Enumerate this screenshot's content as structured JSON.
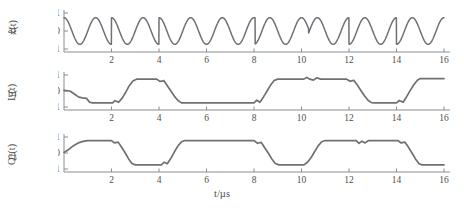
{
  "figure": {
    "panels": [
      {
        "letter": "a)",
        "ylabel_main": "x(t)",
        "ylabel_sub": "",
        "yticks": [
          "1",
          "0",
          "-1"
        ],
        "xticks": [
          "2",
          "4",
          "6",
          "8",
          "10",
          "12",
          "14",
          "16"
        ]
      },
      {
        "letter": "b)",
        "ylabel_main": "I",
        "ylabel_sub": "1",
        "ylabel_tail": "(t)",
        "yticks": [
          "1",
          "0",
          "-1"
        ],
        "xticks": [
          "2",
          "4",
          "6",
          "8",
          "10",
          "12",
          "14",
          "16"
        ]
      },
      {
        "letter": "c)",
        "ylabel_main": "Q",
        "ylabel_sub": "1",
        "ylabel_tail": "(t)",
        "yticks": [
          "1",
          "0",
          "-1"
        ],
        "xticks": [
          "2",
          "4",
          "6",
          "8",
          "10",
          "12",
          "14",
          "16"
        ]
      }
    ],
    "xaxis_label": "t/µs",
    "colors": {
      "trace": "#6e7075",
      "axis": "#8a8c90",
      "text": "#4f4f4f",
      "background": "#ffffff"
    }
  },
  "chart_data": [
    {
      "type": "line",
      "title": "",
      "panel": "a",
      "ylabel": "x(t)",
      "xlabel": "t/µs",
      "xlim": [
        0,
        16
      ],
      "ylim": [
        -1.35,
        1.35
      ],
      "xticks": [
        2,
        4,
        6,
        8,
        10,
        12,
        14,
        16
      ],
      "yticks": [
        -1,
        0,
        1
      ],
      "grid": false,
      "legend": null,
      "description": "Phase-modulated carrier with abrupt phase reversals",
      "carrier_cycles_per_us": 0.75,
      "phase_jumps_at": [
        2.0,
        4.0,
        8.05,
        10.3,
        12.0,
        14.0
      ],
      "x": [
        0,
        0.1,
        0.2,
        0.3,
        0.4,
        0.5,
        0.6,
        0.7,
        0.8,
        0.9,
        1,
        1.1,
        1.2,
        1.3,
        1.4,
        1.5,
        1.6,
        1.7,
        1.8,
        1.9,
        2,
        2.1,
        2.2,
        2.3,
        2.4,
        2.5,
        2.6,
        2.7,
        2.8,
        2.9,
        3,
        3.1,
        3.2,
        3.3,
        3.4,
        3.5,
        3.6,
        3.7,
        3.8,
        3.9,
        4,
        4.1,
        4.2,
        4.3,
        4.4,
        4.5,
        4.6,
        4.7,
        4.8,
        4.9,
        5,
        5.1,
        5.2,
        5.3,
        5.4,
        5.5,
        5.6,
        5.7,
        5.8,
        5.9,
        6,
        6.2,
        6.4,
        6.6,
        6.8,
        7,
        7.2,
        7.4,
        7.6,
        7.8,
        8,
        8.2,
        8.4,
        8.6,
        8.8,
        9,
        9.2,
        9.4,
        9.6,
        9.8,
        10,
        10.2,
        10.4,
        10.6,
        10.8,
        11,
        11.2,
        11.4,
        11.6,
        11.8,
        12,
        12.2,
        12.4,
        12.6,
        12.8,
        13,
        13.2,
        13.4,
        13.6,
        13.8,
        14,
        14.2,
        14.4,
        14.6,
        14.8,
        15,
        15.2,
        15.4,
        15.6,
        15.8,
        16
      ],
      "y_note": "y = cos(2*pi*0.75*t + phi(t)) with phi switching by pi at the listed jump times"
    },
    {
      "type": "line",
      "panel": "b",
      "ylabel": "I1(t)",
      "xlabel": "t/µs",
      "xlim": [
        0,
        16
      ],
      "ylim": [
        -1.35,
        1.35
      ],
      "xticks": [
        2,
        4,
        6,
        8,
        10,
        12,
        14,
        16
      ],
      "yticks": [
        -1,
        0,
        1
      ],
      "grid": false,
      "description": "In-phase baseband component: smoothed bipolar symbol stream",
      "points": [
        [
          0.0,
          0.05
        ],
        [
          0.25,
          0.0
        ],
        [
          0.45,
          -0.28
        ],
        [
          0.62,
          -0.52
        ],
        [
          0.78,
          -0.58
        ],
        [
          0.95,
          -0.62
        ],
        [
          1.08,
          -0.95
        ],
        [
          1.2,
          -1.0
        ],
        [
          2.05,
          -1.0
        ],
        [
          2.15,
          -0.82
        ],
        [
          2.3,
          -0.95
        ],
        [
          2.45,
          -0.6
        ],
        [
          2.6,
          -0.1
        ],
        [
          2.75,
          0.45
        ],
        [
          2.9,
          0.85
        ],
        [
          3.05,
          1.0
        ],
        [
          3.9,
          1.0
        ],
        [
          4.05,
          0.8
        ],
        [
          4.2,
          0.88
        ],
        [
          4.35,
          0.45
        ],
        [
          4.5,
          0.0
        ],
        [
          4.65,
          -0.45
        ],
        [
          4.8,
          -0.8
        ],
        [
          4.95,
          -1.0
        ],
        [
          5.1,
          -1.0
        ],
        [
          8.0,
          -1.0
        ],
        [
          8.12,
          -0.78
        ],
        [
          8.25,
          -0.95
        ],
        [
          8.4,
          -0.5
        ],
        [
          8.55,
          0.0
        ],
        [
          8.7,
          0.5
        ],
        [
          8.85,
          0.88
        ],
        [
          9.0,
          1.0
        ],
        [
          10.1,
          1.0
        ],
        [
          10.22,
          1.15
        ],
        [
          10.35,
          1.0
        ],
        [
          10.5,
          0.92
        ],
        [
          10.65,
          1.12
        ],
        [
          10.8,
          1.0
        ],
        [
          11.9,
          1.0
        ],
        [
          12.05,
          0.82
        ],
        [
          12.2,
          0.9
        ],
        [
          12.35,
          0.5
        ],
        [
          12.5,
          0.05
        ],
        [
          12.65,
          -0.4
        ],
        [
          12.8,
          -0.78
        ],
        [
          12.95,
          -0.98
        ],
        [
          13.1,
          -1.0
        ],
        [
          14.0,
          -1.0
        ],
        [
          14.12,
          -0.8
        ],
        [
          14.28,
          -0.95
        ],
        [
          14.42,
          -0.5
        ],
        [
          14.58,
          0.05
        ],
        [
          14.72,
          0.5
        ],
        [
          14.88,
          0.9
        ],
        [
          15.0,
          1.05
        ],
        [
          16.0,
          1.05
        ]
      ]
    },
    {
      "type": "line",
      "panel": "c",
      "ylabel": "Q1(t)",
      "xlabel": "t/µs",
      "xlim": [
        0,
        16
      ],
      "ylim": [
        -1.35,
        1.35
      ],
      "xticks": [
        2,
        4,
        6,
        8,
        10,
        12,
        14,
        16
      ],
      "yticks": [
        -1,
        0,
        1
      ],
      "grid": false,
      "description": "Quadrature baseband component: smoothed bipolar symbol stream",
      "points": [
        [
          0.0,
          0.05
        ],
        [
          0.2,
          0.3
        ],
        [
          0.4,
          0.62
        ],
        [
          0.6,
          0.85
        ],
        [
          0.8,
          0.98
        ],
        [
          1.0,
          1.05
        ],
        [
          2.0,
          1.05
        ],
        [
          2.12,
          0.85
        ],
        [
          2.28,
          0.92
        ],
        [
          2.42,
          0.5
        ],
        [
          2.58,
          0.0
        ],
        [
          2.72,
          -0.5
        ],
        [
          2.86,
          -0.88
        ],
        [
          3.0,
          -1.0
        ],
        [
          4.1,
          -1.0
        ],
        [
          4.22,
          -0.78
        ],
        [
          4.35,
          -0.9
        ],
        [
          4.5,
          -0.45
        ],
        [
          4.65,
          0.1
        ],
        [
          4.8,
          0.6
        ],
        [
          4.95,
          0.95
        ],
        [
          5.08,
          1.05
        ],
        [
          8.0,
          1.05
        ],
        [
          8.15,
          0.82
        ],
        [
          8.3,
          0.9
        ],
        [
          8.45,
          0.45
        ],
        [
          8.6,
          0.0
        ],
        [
          8.75,
          -0.5
        ],
        [
          8.9,
          -0.88
        ],
        [
          9.05,
          -1.0
        ],
        [
          10.1,
          -1.0
        ],
        [
          10.25,
          -0.78
        ],
        [
          10.4,
          -0.4
        ],
        [
          10.55,
          0.1
        ],
        [
          10.7,
          0.6
        ],
        [
          10.85,
          0.95
        ],
        [
          11.0,
          1.05
        ],
        [
          12.3,
          1.05
        ],
        [
          12.42,
          0.82
        ],
        [
          12.55,
          1.0
        ],
        [
          12.68,
          0.85
        ],
        [
          12.82,
          1.05
        ],
        [
          13.0,
          1.05
        ],
        [
          14.05,
          1.05
        ],
        [
          14.2,
          0.85
        ],
        [
          14.35,
          0.92
        ],
        [
          14.5,
          0.5
        ],
        [
          14.65,
          0.0
        ],
        [
          14.8,
          -0.5
        ],
        [
          14.95,
          -0.9
        ],
        [
          15.08,
          -1.0
        ],
        [
          16.0,
          -1.0
        ]
      ]
    }
  ]
}
